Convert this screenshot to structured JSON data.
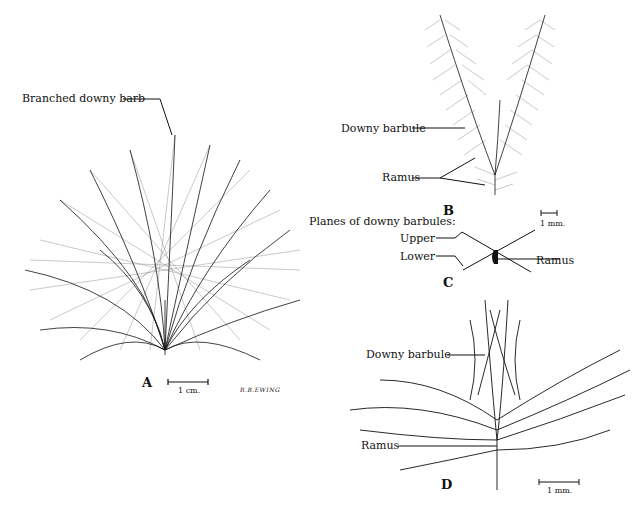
{
  "figure": {
    "panels": {
      "A": {
        "letter": "A",
        "label_barb": "Branched downy barb",
        "scale": "1 cm.",
        "signature": "R.B.EWING"
      },
      "B": {
        "letter": "B",
        "label_barbule": "Downy barbule",
        "label_ramus": "Ramus",
        "scale": "1 mm."
      },
      "C": {
        "letter": "C",
        "title": "Planes of downy barbules:",
        "upper": "Upper",
        "lower": "Lower",
        "ramus": "Ramus"
      },
      "D": {
        "letter": "D",
        "label_barbule": "Downy barbule",
        "label_ramus": "Ramus",
        "scale": "1 mm."
      }
    },
    "colors": {
      "ink": "#111111",
      "background": "#ffffff"
    }
  }
}
